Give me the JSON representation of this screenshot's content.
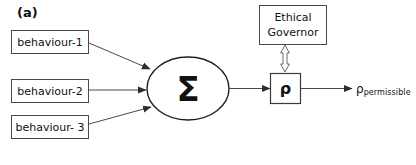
{
  "figure": {
    "panel_label": "(a)",
    "background_color": "#ffffff",
    "stroke_color": "#3a3a3a",
    "text_color": "#111111"
  },
  "inputs": [
    {
      "label": "behaviour-1",
      "name": "behaviour-1"
    },
    {
      "label": "behaviour-2",
      "name": "behaviour-2"
    },
    {
      "label": "behaviour- 3",
      "name": "behaviour-3"
    }
  ],
  "nodes": {
    "summation": {
      "label": "Σ",
      "icon": "sigma-symbol",
      "shape": "ellipse"
    },
    "ethical_governor": {
      "line1": "Ethical",
      "line2": "Governor",
      "shape": "rectangle"
    },
    "rho": {
      "label": "ρ",
      "shape": "rectangle"
    }
  },
  "output": {
    "symbol": "ρ",
    "subscript": "permissible"
  },
  "edges": [
    {
      "name": "behaviour-1-to-summation",
      "from": "behaviour-1",
      "to": "summation",
      "arrow": "solid"
    },
    {
      "name": "behaviour-2-to-summation",
      "from": "behaviour-2",
      "to": "summation",
      "arrow": "solid"
    },
    {
      "name": "behaviour-3-to-summation",
      "from": "behaviour-3",
      "to": "summation",
      "arrow": "solid"
    },
    {
      "name": "summation-to-rho",
      "from": "summation",
      "to": "rho",
      "arrow": "solid"
    },
    {
      "name": "rho-to-governor",
      "from": "rho",
      "to": "ethical_governor",
      "arrow": "hollow-double"
    },
    {
      "name": "rho-to-output",
      "from": "rho",
      "to": "output",
      "arrow": "solid"
    }
  ]
}
